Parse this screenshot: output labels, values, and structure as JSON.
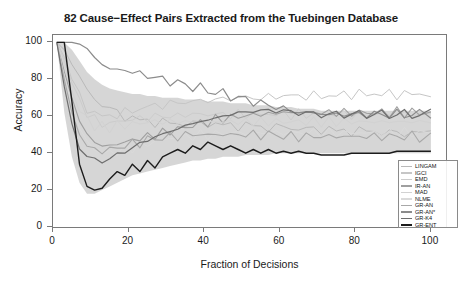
{
  "chart_data": {
    "type": "line",
    "title": "82 Cause−Effect Pairs Extracted from the Tuebingen Database",
    "xlabel": "Fraction of Decisions",
    "ylabel": "Accuracy",
    "xlim": [
      0,
      104
    ],
    "ylim": [
      0,
      104
    ],
    "xticks": [
      0,
      20,
      40,
      60,
      80,
      100
    ],
    "yticks": [
      0,
      20,
      40,
      60,
      80,
      100
    ],
    "grid": false,
    "legend_position": "bottom-right",
    "x": [
      1,
      3,
      5,
      7,
      9,
      11,
      13,
      15,
      17,
      19,
      21,
      23,
      25,
      27,
      29,
      31,
      33,
      35,
      37,
      39,
      41,
      43,
      45,
      47,
      49,
      51,
      53,
      55,
      57,
      59,
      61,
      63,
      65,
      67,
      69,
      71,
      73,
      75,
      77,
      79,
      81,
      83,
      85,
      87,
      89,
      91,
      93,
      95,
      97,
      100
    ],
    "series": [
      {
        "name": "LINGAM",
        "color": "#b9b9b9",
        "width": 1.0,
        "values": [
          100,
          96,
          88,
          80,
          74,
          70,
          66,
          64,
          62,
          60,
          59,
          58,
          57,
          57,
          57,
          56,
          56,
          56,
          56,
          56,
          56,
          56,
          55,
          55,
          55,
          55,
          55,
          54,
          54,
          54,
          54,
          54,
          53,
          53,
          53,
          53,
          53,
          52,
          52,
          52,
          52,
          52,
          52,
          51,
          51,
          51,
          51,
          51,
          51,
          51
        ]
      },
      {
        "name": "IGCI",
        "color": "#c6c6c6",
        "width": 1.0,
        "values": [
          100,
          92,
          80,
          70,
          64,
          62,
          60,
          60,
          61,
          62,
          63,
          64,
          65,
          66,
          66,
          67,
          67,
          68,
          68,
          68,
          69,
          69,
          69,
          70,
          70,
          70,
          70,
          70,
          70,
          71,
          71,
          71,
          71,
          71,
          71,
          71,
          71,
          71,
          72,
          72,
          72,
          72,
          72,
          72,
          72,
          72,
          72,
          72,
          72,
          72
        ]
      },
      {
        "name": "EMD",
        "color": "#cccccc",
        "width": 1.0,
        "values": [
          100,
          90,
          78,
          68,
          62,
          58,
          56,
          56,
          57,
          58,
          58,
          59,
          59,
          60,
          60,
          60,
          60,
          61,
          61,
          61,
          61,
          61,
          61,
          61,
          61,
          61,
          61,
          61,
          61,
          61,
          61,
          61,
          61,
          61,
          61,
          61,
          61,
          61,
          61,
          61,
          61,
          61,
          61,
          61,
          61,
          61,
          61,
          61,
          61,
          61
        ]
      },
      {
        "name": "IR-AN",
        "color": "#9f9f9f",
        "width": 1.1,
        "values": [
          100,
          84,
          70,
          58,
          50,
          46,
          44,
          44,
          45,
          46,
          47,
          48,
          49,
          50,
          51,
          52,
          53,
          54,
          55,
          56,
          57,
          58,
          59,
          59,
          60,
          60,
          61,
          61,
          61,
          62,
          62,
          62,
          62,
          62,
          62,
          62,
          62,
          62,
          62,
          62,
          62,
          62,
          62,
          62,
          62,
          62,
          62,
          62,
          62,
          62
        ]
      },
      {
        "name": "MAD",
        "color": "#d2d2d2",
        "width": 1.0,
        "values": [
          100,
          88,
          74,
          64,
          58,
          55,
          54,
          54,
          55,
          55,
          56,
          56,
          57,
          57,
          57,
          57,
          57,
          57,
          57,
          57,
          57,
          57,
          57,
          57,
          57,
          57,
          57,
          57,
          57,
          57,
          57,
          57,
          57,
          57,
          57,
          57,
          57,
          57,
          57,
          57,
          57,
          57,
          57,
          57,
          57,
          57,
          57,
          57,
          57,
          57
        ]
      },
      {
        "name": "NLME",
        "color": "#dadada",
        "width": 1.0,
        "values": [
          100,
          82,
          66,
          54,
          46,
          42,
          40,
          40,
          41,
          42,
          43,
          44,
          45,
          46,
          47,
          48,
          48,
          49,
          49,
          50,
          50,
          50,
          51,
          51,
          51,
          51,
          51,
          51,
          51,
          51,
          51,
          51,
          51,
          51,
          51,
          51,
          51,
          51,
          51,
          51,
          51,
          51,
          51,
          51,
          51,
          51,
          51,
          51,
          51,
          51
        ]
      },
      {
        "name": "GR-AN",
        "color": "#a8a8a8",
        "width": 1.1,
        "values": [
          100,
          80,
          62,
          50,
          44,
          42,
          41,
          42,
          43,
          44,
          45,
          46,
          47,
          48,
          48,
          49,
          49,
          50,
          50,
          50,
          50,
          50,
          50,
          50,
          50,
          50,
          50,
          50,
          50,
          50,
          49,
          49,
          49,
          49,
          49,
          49,
          49,
          49,
          49,
          49,
          49,
          49,
          49,
          49,
          49,
          49,
          49,
          49,
          49,
          49
        ]
      },
      {
        "name": "GR-AN*",
        "color": "#8c8c8c",
        "width": 1.2,
        "values": [
          100,
          100,
          100,
          100,
          96,
          92,
          88,
          86,
          85,
          85,
          84,
          83,
          82,
          81,
          80,
          79,
          78,
          77,
          76,
          75,
          74,
          73,
          72,
          71,
          70,
          69,
          68,
          67,
          66,
          65,
          64,
          63,
          62,
          62,
          62,
          61,
          61,
          61,
          61,
          61,
          61,
          61,
          61,
          61,
          61,
          61,
          61,
          61,
          61,
          62
        ]
      },
      {
        "name": "GR-K4",
        "color": "#6e6e6e",
        "width": 1.2,
        "values": [
          100,
          76,
          56,
          44,
          38,
          36,
          36,
          37,
          39,
          41,
          43,
          45,
          47,
          49,
          50,
          52,
          53,
          55,
          56,
          57,
          58,
          59,
          60,
          61,
          62,
          62,
          63,
          63,
          63,
          63,
          63,
          62,
          62,
          62,
          61,
          61,
          61,
          61,
          61,
          61,
          61,
          61,
          61,
          61,
          61,
          61,
          61,
          61,
          61,
          61
        ]
      },
      {
        "name": "GR-ENT",
        "color": "#1c1c1c",
        "width": 1.4,
        "values": [
          100,
          100,
          68,
          34,
          22,
          20,
          21,
          26,
          30,
          28,
          34,
          30,
          36,
          32,
          38,
          40,
          42,
          40,
          44,
          42,
          46,
          44,
          42,
          44,
          42,
          40,
          42,
          40,
          42,
          40,
          41,
          40,
          41,
          40,
          40,
          39,
          39,
          39,
          39,
          40,
          40,
          40,
          40,
          40,
          40,
          41,
          41,
          41,
          41,
          41
        ]
      }
    ],
    "band": {
      "color": "#cfcfcf",
      "opacity": 0.85,
      "upper": [
        100,
        100,
        96,
        90,
        84,
        80,
        77,
        75,
        74,
        73,
        72,
        72,
        71,
        71,
        70,
        70,
        70,
        69,
        69,
        69,
        68,
        68,
        68,
        67,
        67,
        67,
        66,
        66,
        66,
        65,
        65,
        65,
        64,
        64,
        64,
        63,
        63,
        63,
        63,
        63,
        63,
        63,
        63,
        63,
        63,
        63,
        63,
        63,
        63,
        63
      ],
      "lower": [
        100,
        62,
        38,
        24,
        18,
        18,
        20,
        22,
        24,
        26,
        28,
        29,
        30,
        31,
        32,
        33,
        34,
        35,
        36,
        36,
        37,
        37,
        38,
        38,
        38,
        39,
        39,
        39,
        39,
        40,
        40,
        40,
        40,
        40,
        40,
        40,
        40,
        40,
        40,
        40,
        40,
        40,
        40,
        40,
        40,
        40,
        40,
        40,
        40,
        40
      ]
    }
  },
  "legend": {
    "items": [
      {
        "label": "LINGAM"
      },
      {
        "label": "IGCI"
      },
      {
        "label": "EMD"
      },
      {
        "label": "IR-AN"
      },
      {
        "label": "MAD"
      },
      {
        "label": "NLME"
      },
      {
        "label": "GR-AN"
      },
      {
        "label": "GR-AN*"
      },
      {
        "label": "GR-K4"
      },
      {
        "label": "GR-ENT"
      }
    ]
  },
  "axes": {
    "y_tick_labels": [
      "0",
      "20",
      "40",
      "60",
      "80",
      "100"
    ],
    "x_tick_labels": [
      "0",
      "20",
      "40",
      "60",
      "80",
      "100"
    ]
  }
}
